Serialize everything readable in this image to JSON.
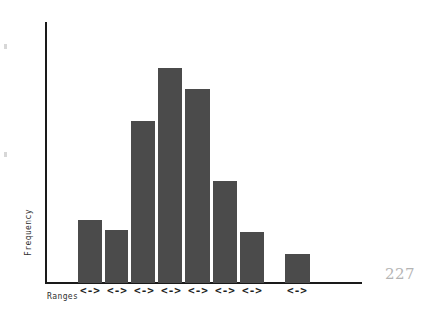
{
  "page": {
    "page_number": "227",
    "background_color": "#ffffff"
  },
  "chart_data": {
    "type": "bar",
    "title": "",
    "subtitle": "",
    "xlabel": "Ranges",
    "ylabel": "Frequency",
    "grid": false,
    "legend": null,
    "bar_color": "#4b4b4b",
    "axis_color": "#1a1a1a",
    "ylim": [
      0,
      10
    ],
    "categories": [
      "<->",
      "<->",
      "<->",
      "<->",
      "<->",
      "<->",
      "<->",
      "",
      "<->"
    ],
    "values": [
      2.4,
      2.0,
      6.2,
      8.2,
      7.4,
      3.9,
      2.0,
      0,
      1.1
    ],
    "tick_labels": [
      "<->",
      "<->",
      "<->",
      "<->",
      "<->",
      "<->",
      "<->",
      "<->"
    ],
    "bars": [
      {
        "index": 1,
        "label": "<->",
        "value": 2.4,
        "left_px": 31,
        "width_px": 24,
        "height_px": 63
      },
      {
        "index": 2,
        "label": "<->",
        "value": 2.0,
        "left_px": 58,
        "width_px": 23,
        "height_px": 53
      },
      {
        "index": 3,
        "label": "<->",
        "value": 6.2,
        "left_px": 84,
        "width_px": 24,
        "height_px": 162
      },
      {
        "index": 4,
        "label": "<->",
        "value": 8.2,
        "left_px": 111,
        "width_px": 24,
        "height_px": 215
      },
      {
        "index": 5,
        "label": "<->",
        "value": 7.4,
        "left_px": 138,
        "width_px": 25,
        "height_px": 194
      },
      {
        "index": 6,
        "label": "<->",
        "value": 3.9,
        "left_px": 166,
        "width_px": 24,
        "height_px": 102
      },
      {
        "index": 7,
        "label": "<->",
        "value": 2.0,
        "left_px": 193,
        "width_px": 24,
        "height_px": 51
      },
      {
        "index": 8,
        "label": "<->",
        "value": 1.1,
        "left_px": 238,
        "width_px": 25,
        "height_px": 29
      }
    ],
    "marker_positions": [
      {
        "label": "<->",
        "left_px": 28,
        "width_px": 30
      },
      {
        "label": "<->",
        "left_px": 55,
        "width_px": 30
      },
      {
        "label": "<->",
        "left_px": 82,
        "width_px": 30
      },
      {
        "label": "<->",
        "left_px": 109,
        "width_px": 30
      },
      {
        "label": "<->",
        "left_px": 136,
        "width_px": 30
      },
      {
        "label": "<->",
        "left_px": 163,
        "width_px": 30
      },
      {
        "label": "<->",
        "left_px": 190,
        "width_px": 30
      },
      {
        "label": "<->",
        "left_px": 235,
        "width_px": 30
      }
    ]
  }
}
